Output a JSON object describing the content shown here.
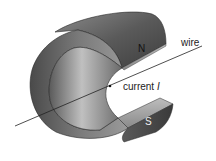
{
  "diagram": {
    "labels": {
      "north_pole": "N",
      "south_pole": "S",
      "wire": "wire",
      "current_prefix": "current ",
      "current_symbol": "I"
    },
    "colors": {
      "magnet_dark": "#3c3c3c",
      "magnet_mid": "#6e6e6e",
      "magnet_light": "#b5b5b5",
      "wire": "#222222",
      "background": "#ffffff"
    }
  }
}
